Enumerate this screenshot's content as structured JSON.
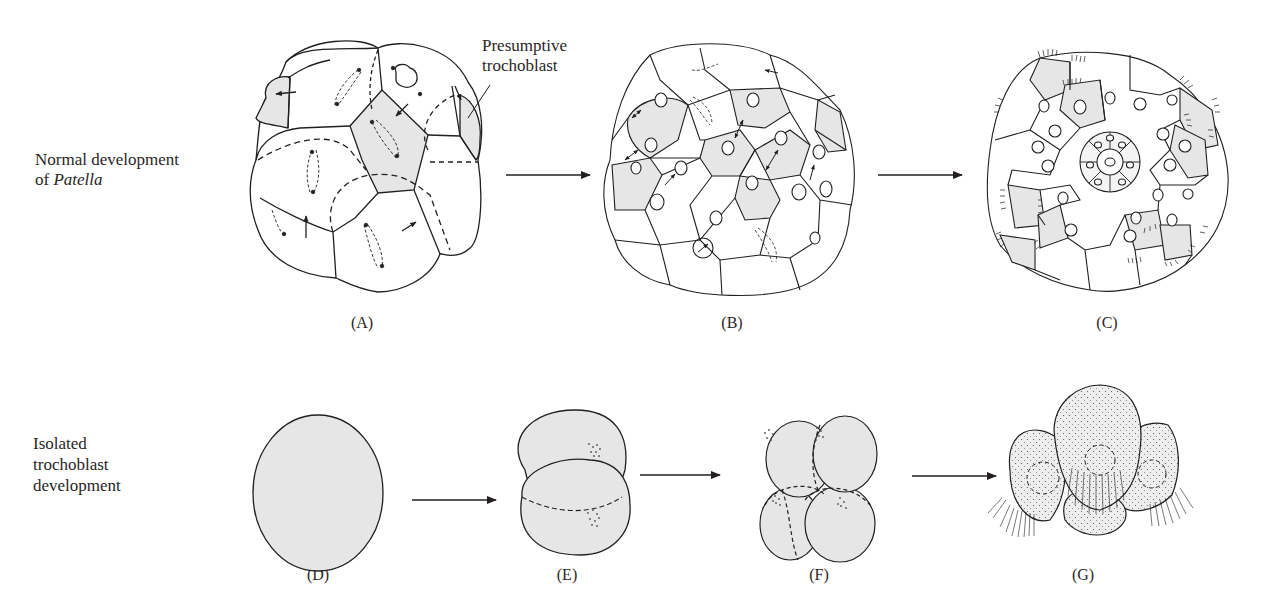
{
  "figure": {
    "rows": [
      {
        "id": "normal",
        "label_line1": "Normal development",
        "label_line2_prefix": "of ",
        "label_line2_italic": "Patella",
        "panels": [
          {
            "id": "A",
            "label": "(A)"
          },
          {
            "id": "B",
            "label": "(B)"
          },
          {
            "id": "C",
            "label": "(C)"
          }
        ]
      },
      {
        "id": "isolated",
        "label_line1": "Isolated",
        "label_line2": "trochoblast",
        "label_line3": "development",
        "panels": [
          {
            "id": "D",
            "label": "(D)"
          },
          {
            "id": "E",
            "label": "(E)"
          },
          {
            "id": "F",
            "label": "(F)"
          },
          {
            "id": "G",
            "label": "(G)"
          }
        ]
      }
    ],
    "annotation": {
      "line1": "Presumptive",
      "line2": "trochoblast"
    },
    "colors": {
      "shaded_cell": "#e6e6e6",
      "outline": "#231f20",
      "background": "#ffffff"
    }
  }
}
